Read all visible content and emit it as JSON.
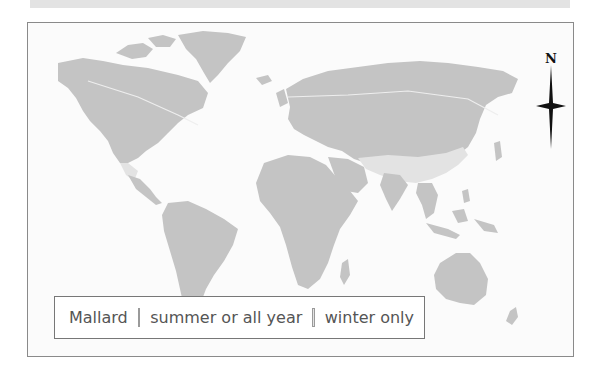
{
  "colors": {
    "summer_or_all_year": "#c4c4c4",
    "winter_only": "#e3e3e3",
    "ocean": "#fbfbfb",
    "frame_border": "#8a8a8a"
  },
  "compass": {
    "label": "N",
    "icon": "north-arrow-compass-icon"
  },
  "legend": {
    "title": "Mallard",
    "items": [
      {
        "label": "summer or all year",
        "color": "#c4c4c4"
      },
      {
        "label": "winter only",
        "color": "#e3e3e3"
      }
    ]
  }
}
